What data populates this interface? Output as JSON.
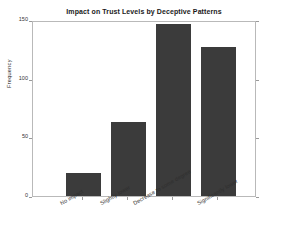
{
  "chart_data": {
    "type": "bar",
    "title": "Impact on Trust Levels by Deceptive Patterns",
    "xlabel": "",
    "ylabel": "Frequency",
    "categories": [
      "No impact",
      "Slightly lower",
      "Decrease to some degree",
      "Significantly lower"
    ],
    "values": [
      20,
      63,
      147,
      127
    ],
    "ylim": [
      0,
      150
    ],
    "yticks": [
      0,
      50,
      100,
      150
    ],
    "ytick_labels": [
      "0",
      "50",
      "100",
      "150"
    ],
    "grid": false,
    "legend": null,
    "bar_color": "#3b3b3b",
    "background_color": "#ffffff",
    "axis_color": "#b9b9b9"
  }
}
